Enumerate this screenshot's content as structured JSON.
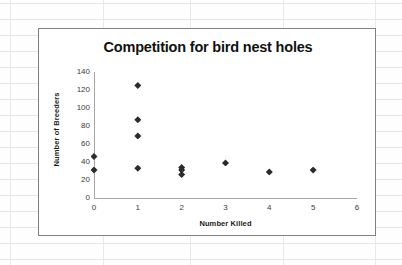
{
  "background": {
    "type": "spreadsheet-grid",
    "grid_color": "#e2e6ea",
    "h_lines_y": [
      3,
      19,
      35,
      51,
      67,
      83,
      99,
      115,
      131,
      147,
      163,
      179,
      195,
      211,
      227,
      243,
      259
    ],
    "v_lines_x": [
      10,
      103,
      190,
      283,
      375
    ]
  },
  "chart_object": {
    "border_color": "#808080",
    "plot_background": "#ffffff"
  },
  "chart_data": {
    "type": "scatter",
    "title": "Competition for bird nest holes",
    "xlabel": "Number Killed",
    "ylabel": "Number of Breeders",
    "xlim": [
      0,
      6
    ],
    "ylim": [
      0,
      140
    ],
    "xticks": [
      "0",
      "1",
      "2",
      "3",
      "4",
      "5",
      "6"
    ],
    "xtick_values": [
      0,
      1,
      2,
      3,
      4,
      5,
      6
    ],
    "yticks": [
      "0",
      "20",
      "40",
      "60",
      "80",
      "100",
      "120",
      "140"
    ],
    "ytick_values": [
      0,
      20,
      40,
      60,
      80,
      100,
      120,
      140
    ],
    "grid": false,
    "legend": false,
    "marker": "diamond",
    "marker_color": "#2b2b2b",
    "series": [
      {
        "name": "Breeders vs Killed",
        "points": [
          {
            "x": 0,
            "y": 46
          },
          {
            "x": 0,
            "y": 31
          },
          {
            "x": 1,
            "y": 125
          },
          {
            "x": 1,
            "y": 87
          },
          {
            "x": 1,
            "y": 69
          },
          {
            "x": 1,
            "y": 33
          },
          {
            "x": 2,
            "y": 34
          },
          {
            "x": 2,
            "y": 31
          },
          {
            "x": 2,
            "y": 26
          },
          {
            "x": 3,
            "y": 39
          },
          {
            "x": 4,
            "y": 29
          },
          {
            "x": 5,
            "y": 31
          }
        ]
      }
    ]
  }
}
